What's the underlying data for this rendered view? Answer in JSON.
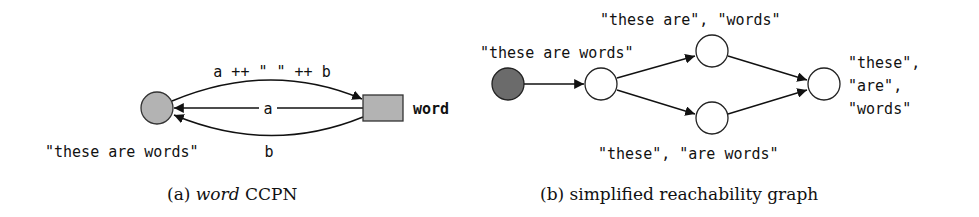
{
  "figure": {
    "panel_a": {
      "caption_prefix": "(a) ",
      "caption_italic": "word",
      "caption_suffix": " CCPN",
      "place": {
        "shape": "circle",
        "fill": "#b3b3b3",
        "initial_marking": "\"these are words\""
      },
      "transition": {
        "shape": "rectangle",
        "fill": "#b3b3b3",
        "name": "word"
      },
      "arcs": [
        {
          "from": "place",
          "to": "transition",
          "label": "a ++ \" \" ++ b",
          "direction": "top"
        },
        {
          "from": "transition",
          "to": "place",
          "label": "a",
          "direction": "middle"
        },
        {
          "from": "transition",
          "to": "place",
          "label": "b",
          "direction": "bottom"
        }
      ]
    },
    "panel_b": {
      "caption": "(b) simplified reachability graph",
      "nodes": [
        {
          "id": "s0",
          "fill": "#6b6b6b",
          "label": ""
        },
        {
          "id": "s1",
          "fill": "#ffffff",
          "label": "\"these are words\""
        },
        {
          "id": "s2",
          "fill": "#ffffff",
          "label": "\"these are\", \"words\""
        },
        {
          "id": "s3",
          "fill": "#ffffff",
          "label": "\"these\", \"are words\""
        },
        {
          "id": "s4",
          "fill": "#ffffff",
          "label_lines": [
            "\"these\",",
            "\"are\",",
            "\"words\""
          ]
        }
      ],
      "edges": [
        {
          "from": "s0",
          "to": "s1"
        },
        {
          "from": "s1",
          "to": "s2"
        },
        {
          "from": "s1",
          "to": "s3"
        },
        {
          "from": "s2",
          "to": "s4"
        },
        {
          "from": "s3",
          "to": "s4"
        }
      ]
    }
  }
}
